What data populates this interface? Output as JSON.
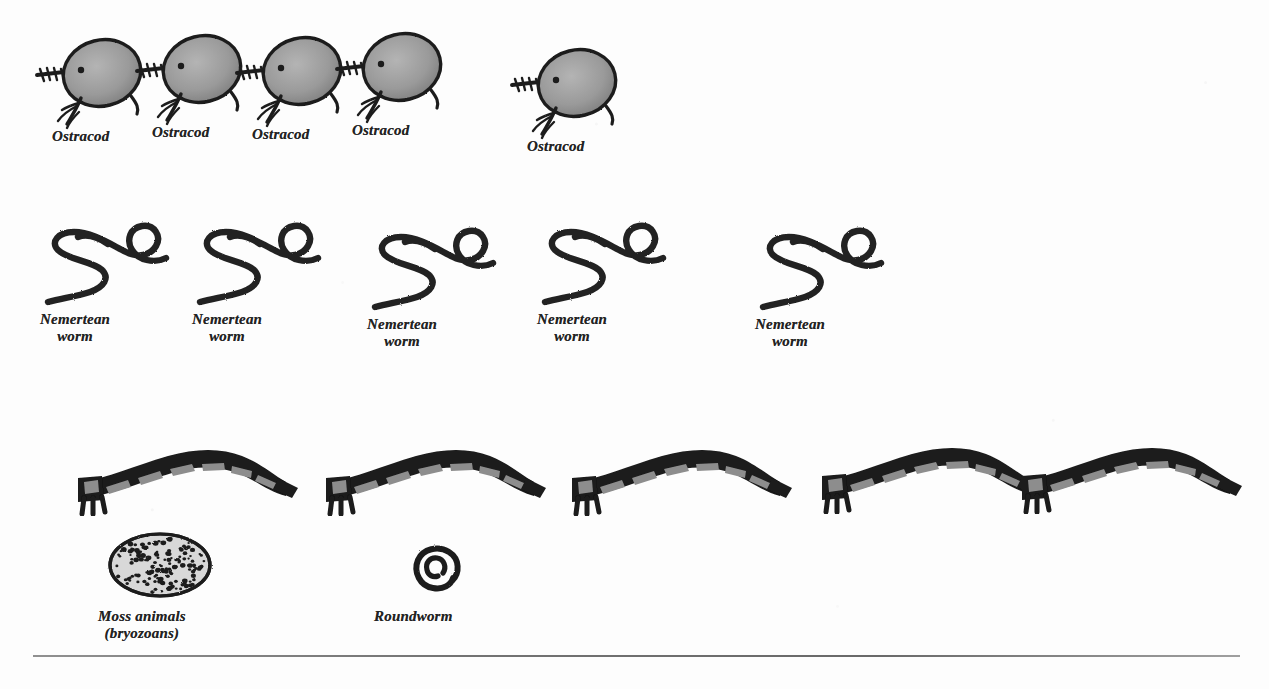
{
  "plate": {
    "background_color": "#fdfdfd",
    "ink_color": "#232323",
    "body_fill_color": "#8f8f8f",
    "outline_color": "#1f1f1f",
    "rule_color": "#5b5b5b",
    "width": 1269,
    "height": 689
  },
  "rows": [
    {
      "id": "ostracod-row",
      "creature": "ostracod",
      "count": 5,
      "figures": [
        {
          "label": "Ostracod",
          "x": 33,
          "y": 28,
          "label_x": 52,
          "label_y": 128
        },
        {
          "label": "Ostracod",
          "x": 133,
          "y": 24,
          "label_x": 152,
          "label_y": 124
        },
        {
          "label": "Ostracod",
          "x": 233,
          "y": 26,
          "label_x": 252,
          "label_y": 126
        },
        {
          "label": "Ostracod",
          "x": 333,
          "y": 22,
          "label_x": 352,
          "label_y": 122
        },
        {
          "label": "Ostracod",
          "x": 508,
          "y": 38,
          "label_x": 527,
          "label_y": 138
        }
      ]
    },
    {
      "id": "nemertean-row",
      "creature": "nemertean-worm",
      "count": 5,
      "figures": [
        {
          "label": "Nemertean\nworm",
          "x": 38,
          "y": 206,
          "label_x": 40,
          "label_y": 311
        },
        {
          "label": "Nemertean\nworm",
          "x": 190,
          "y": 206,
          "label_x": 192,
          "label_y": 311
        },
        {
          "label": "Nemertean\nworm",
          "x": 365,
          "y": 211,
          "label_x": 367,
          "label_y": 316
        },
        {
          "label": "Nemertean\nworm",
          "x": 535,
          "y": 206,
          "label_x": 537,
          "label_y": 311
        },
        {
          "label": "Nemertean\nworm",
          "x": 753,
          "y": 211,
          "label_x": 755,
          "label_y": 316
        }
      ]
    },
    {
      "id": "segmented-worm-row",
      "creature": "segmented-worm",
      "count": 5,
      "figures": [
        {
          "label": "",
          "x": 72,
          "y": 438
        },
        {
          "label": "",
          "x": 320,
          "y": 438
        },
        {
          "label": "",
          "x": 566,
          "y": 438
        },
        {
          "label": "",
          "x": 816,
          "y": 436
        },
        {
          "label": "",
          "x": 1016,
          "y": 436
        }
      ]
    },
    {
      "id": "bottom-row",
      "creature": "mixed",
      "count": 2,
      "figures": [
        {
          "creature": "moss-animals",
          "label": "Moss animals\n(bryozoans)",
          "x": 104,
          "y": 528,
          "label_x": 98,
          "label_y": 608
        },
        {
          "creature": "roundworm",
          "label": "Roundworm",
          "x": 408,
          "y": 540,
          "label_x": 374,
          "label_y": 608
        }
      ]
    }
  ],
  "divider": {
    "name": "horizontal-rule",
    "x": 33,
    "y": 655,
    "width": 1207
  }
}
